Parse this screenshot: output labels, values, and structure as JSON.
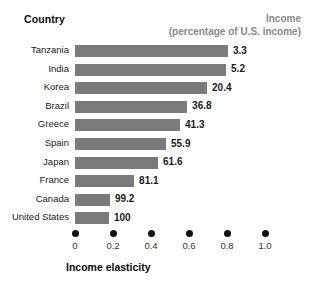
{
  "header": {
    "country_label": "Country",
    "income_label": "Income",
    "income_sublabel": "(percentage of U.S. income)"
  },
  "axis": {
    "title": "Income elasticity",
    "ticks": [
      "0",
      "0.2",
      "0.4",
      "0.6",
      "0.8",
      "1.0"
    ],
    "tick_values": [
      0,
      0.2,
      0.4,
      0.6,
      0.8,
      1.0
    ]
  },
  "colors": {
    "bar": "#7b7b7b",
    "header_muted": "#8a8a8a",
    "text": "#111111"
  },
  "rows": [
    {
      "country": "Tanzania",
      "income": "3.3",
      "elasticity": 0.805
    },
    {
      "country": "India",
      "income": "5.2",
      "elasticity": 0.795
    },
    {
      "country": "Korea",
      "income": "20.4",
      "elasticity": 0.695
    },
    {
      "country": "Brazil",
      "income": "36.8",
      "elasticity": 0.59
    },
    {
      "country": "Greece",
      "income": "41.3",
      "elasticity": 0.553
    },
    {
      "country": "Spain",
      "income": "55.9",
      "elasticity": 0.479
    },
    {
      "country": "Japan",
      "income": "61.6",
      "elasticity": 0.437
    },
    {
      "country": "France",
      "income": "81.1",
      "elasticity": 0.311
    },
    {
      "country": "Canada",
      "income": "99.2",
      "elasticity": 0.184
    },
    {
      "country": "United States",
      "income": "100",
      "elasticity": 0.179
    }
  ],
  "chart_data": {
    "type": "bar",
    "orientation": "horizontal",
    "title": "",
    "xlabel": "Income elasticity",
    "ylabel": "Country",
    "categories": [
      "Tanzania",
      "India",
      "Korea",
      "Brazil",
      "Greece",
      "Spain",
      "Japan",
      "France",
      "Canada",
      "United States"
    ],
    "values": [
      0.805,
      0.795,
      0.695,
      0.59,
      0.553,
      0.479,
      0.437,
      0.311,
      0.184,
      0.179
    ],
    "data_labels": [
      "3.3",
      "5.2",
      "20.4",
      "36.8",
      "41.3",
      "55.9",
      "61.6",
      "81.1",
      "99.2",
      "100"
    ],
    "data_label_header": "Income (percentage of U.S. income)",
    "xlim": [
      0,
      1.0
    ],
    "xticks": [
      0,
      0.2,
      0.4,
      0.6,
      0.8,
      1.0
    ],
    "xticklabels": [
      "0",
      "0.2",
      "0.4",
      "0.6",
      "0.8",
      "1.0"
    ],
    "grid": false,
    "legend": false,
    "bar_color": "#7b7b7b"
  }
}
